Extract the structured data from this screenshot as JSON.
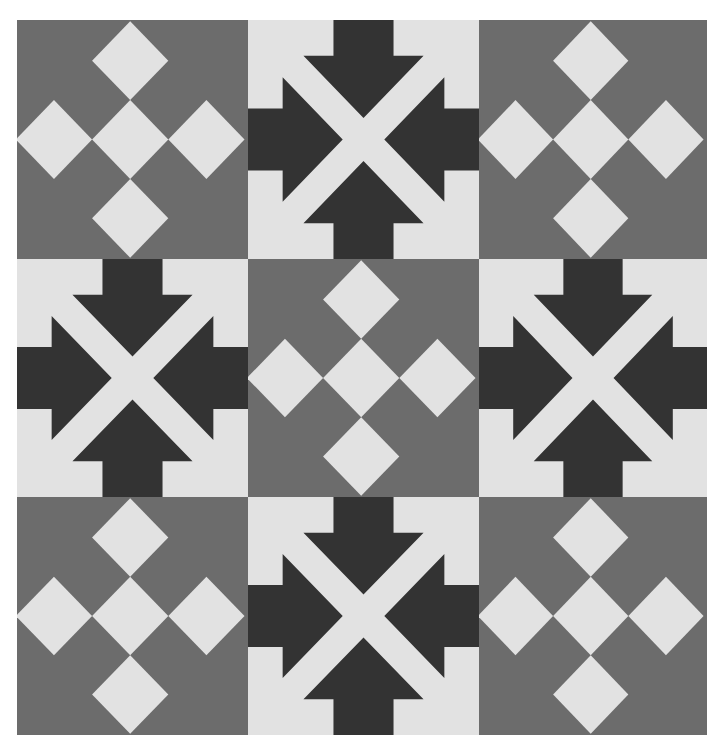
{
  "quilt": {
    "title": "",
    "colors": {
      "medium_gray": "#6c6c6c",
      "light": "#e2e2e2",
      "dark": "#333333",
      "background": "#ffffff"
    },
    "grid": {
      "rows": 3,
      "cols": 3
    },
    "blocks": [
      {
        "row": 0,
        "col": 0,
        "type": "diamond-cross"
      },
      {
        "row": 0,
        "col": 1,
        "type": "arrows-in"
      },
      {
        "row": 0,
        "col": 2,
        "type": "diamond-cross"
      },
      {
        "row": 1,
        "col": 0,
        "type": "arrows-in"
      },
      {
        "row": 1,
        "col": 1,
        "type": "diamond-cross"
      },
      {
        "row": 1,
        "col": 2,
        "type": "arrows-in"
      },
      {
        "row": 2,
        "col": 0,
        "type": "diamond-cross"
      },
      {
        "row": 2,
        "col": 1,
        "type": "arrows-in"
      },
      {
        "row": 2,
        "col": 2,
        "type": "diamond-cross"
      }
    ]
  }
}
